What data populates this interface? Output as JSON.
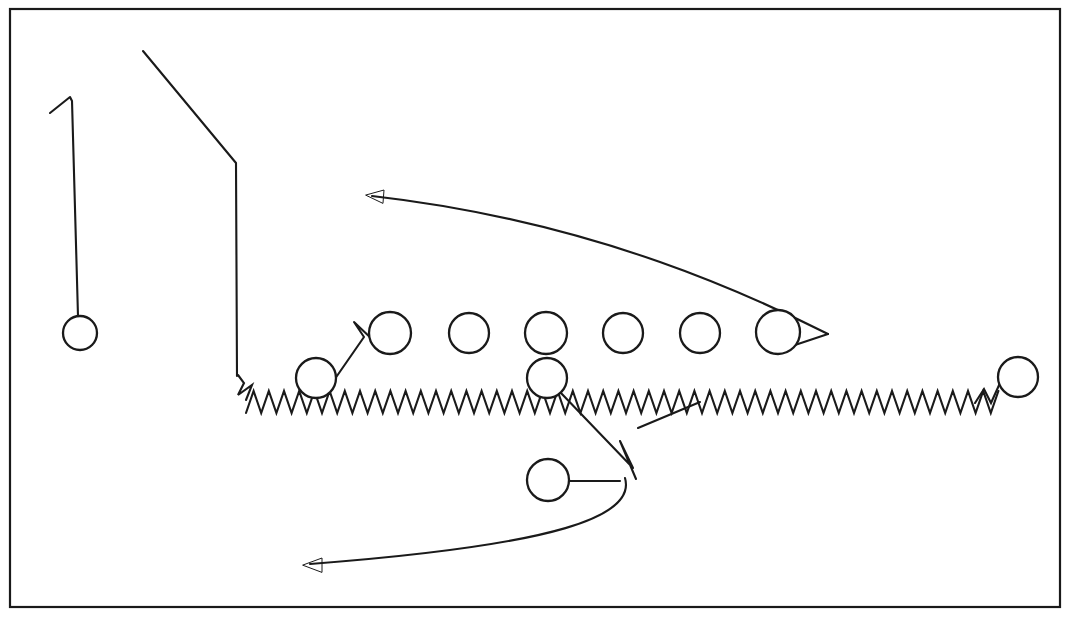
{
  "diagram": {
    "background_color": "#ffffff",
    "ink_color": "#1a1a1a",
    "border": {
      "x": 10,
      "y": 9,
      "width": 1050,
      "height": 598,
      "stroke_width": 2.2
    }
  },
  "chart_data": {
    "type": "diagram",
    "xlabel": "",
    "ylabel": "",
    "width": 1070,
    "height": 617,
    "players": [
      {
        "name": "player-far-left",
        "cx": 80,
        "cy": 333,
        "r": 17
      },
      {
        "name": "player-left-slot",
        "cx": 316,
        "cy": 378,
        "r": 20
      },
      {
        "name": "lineman-1",
        "cx": 390,
        "cy": 333,
        "r": 21
      },
      {
        "name": "lineman-2",
        "cx": 469,
        "cy": 333,
        "r": 20
      },
      {
        "name": "lineman-3",
        "cx": 546,
        "cy": 333,
        "r": 21
      },
      {
        "name": "lineman-4",
        "cx": 623,
        "cy": 333,
        "r": 20
      },
      {
        "name": "lineman-5",
        "cx": 700,
        "cy": 333,
        "r": 20
      },
      {
        "name": "lineman-6",
        "cx": 778,
        "cy": 332,
        "r": 22
      },
      {
        "name": "player-center-back",
        "cx": 547,
        "cy": 378,
        "r": 20
      },
      {
        "name": "player-deep-back",
        "cx": 548,
        "cy": 480,
        "r": 21
      },
      {
        "name": "player-far-right",
        "cx": 1018,
        "cy": 377,
        "r": 20
      }
    ],
    "zigzag": {
      "name": "line-of-scrimmage-zigzag",
      "y_base": 402,
      "amplitude": 11,
      "period": 15.2,
      "x_start": 238,
      "x_end": 1000,
      "lead_in": "M238,375 L244,383 L238,395 L252,385 L246,400",
      "tail_up": "M975,403 L984,389 L991,403 L1000,383"
    },
    "paths": [
      {
        "name": "far-left-stem-route",
        "d": "M50,113 L70,97 L72,101 L78,316"
      },
      {
        "name": "long-diagonal-route",
        "d": "M143,51 L236,163 L237,376"
      },
      {
        "name": "left-slot-break-route",
        "d": "M330,386 L364,337 L354,322 L374,341"
      },
      {
        "name": "top-curved-arrow",
        "d": "M828,334 C760,300 600,222 372,196"
      },
      {
        "name": "top-arrow-head",
        "d": "M366,195 L384,190 L383,203 Z"
      },
      {
        "name": "lineman6-loop",
        "d": "M774,352 L828,334"
      },
      {
        "name": "lineman6-loop-tail",
        "d": "M774,352 L772,331"
      },
      {
        "name": "center-back-down-route",
        "d": "M560,392 L633,468 L620,441 L636,479"
      },
      {
        "name": "deep-back-lead",
        "d": "M569,481 L620,481"
      },
      {
        "name": "bottom-curved-arrow",
        "d": "M625,478 C636,516 560,545 310,564"
      },
      {
        "name": "bottom-arrow-head",
        "d": "M303,565 L322,558 L322,572 Z"
      },
      {
        "name": "right-tail-route",
        "d": "M638,428 L700,402"
      }
    ]
  }
}
